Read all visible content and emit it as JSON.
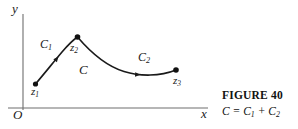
{
  "figure": {
    "axes": {
      "y_label": "y",
      "x_label": "x",
      "origin_label": "O",
      "axis_color": "#6e6e6e",
      "x_axis_y": 108,
      "y_axis_x": 23,
      "x_axis_end": 208,
      "y_axis_top": 14
    },
    "curve": {
      "color": "#1a1a1a",
      "name": "C",
      "label": "C",
      "segments": [
        {
          "name": "C1",
          "label": "C",
          "label_sub": "1",
          "from": "z1",
          "to": "z2",
          "path": "M 35.5,84 C 44,74 52,64 62,52 C 68,45 73,40 77.5,37",
          "arrow_at": [
            58.5,
            56.5
          ],
          "arrow_angle": -51
        },
        {
          "name": "C2",
          "label": "C",
          "label_sub": "2",
          "from": "z2",
          "to": "z3",
          "path": "M 77.5,37 C 92,54 106,66 124,71.5 C 140,76.5 160,76.5 176,70",
          "arrow_at": [
            140.5,
            74.8
          ],
          "arrow_angle": 3
        }
      ]
    },
    "points": [
      {
        "name": "z1",
        "label": "z",
        "sub": "1",
        "x": 35.5,
        "y": 84
      },
      {
        "name": "z2",
        "label": "z",
        "sub": "2",
        "x": 77.5,
        "y": 37
      },
      {
        "name": "z3",
        "label": "z",
        "sub": "3",
        "x": 176,
        "y": 70
      }
    ],
    "point_radius": 2.6,
    "point_color": "#111111"
  },
  "caption": {
    "title": "FIGURE 40",
    "formula_lead": "C = C",
    "formula_sub1": "1",
    "formula_mid": " + C",
    "formula_sub2": "2"
  }
}
